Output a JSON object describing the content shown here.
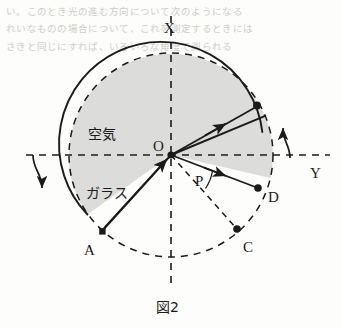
{
  "figure": {
    "caption": "図2",
    "axis_labels": {
      "vertical": "X",
      "horizontal": "Y"
    },
    "region_labels": {
      "air": "空気",
      "glass": "ガラス"
    },
    "point_labels": {
      "center": "O",
      "a": "A",
      "c": "C",
      "d": "D",
      "angle": "P"
    },
    "colors": {
      "ink": "#1b1b1b",
      "glass_fill": "#dcdcda",
      "paper": "#fdfdfc",
      "bleed_text": "#c9c6c2"
    },
    "geometry": {
      "center": [
        171,
        155
      ],
      "radius": 102,
      "sector_start_deg": 13,
      "sector_end_deg": 215,
      "points": {
        "A": [
          102,
          231
        ],
        "C": [
          237,
          229
        ],
        "D": [
          258,
          188
        ],
        "refracted_tip": [
          258,
          105
        ],
        "sector_top_edge": [
          262,
          132
        ]
      }
    }
  },
  "bleed_through": {
    "lines": [
      "い。このとき光の進む方向について次のようになる",
      "れいなものの場合について、これを測定するときには",
      "さきと同じにすれば、いろいろな角度で測られる"
    ]
  }
}
